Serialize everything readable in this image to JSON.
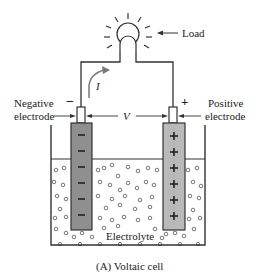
{
  "diagram": {
    "caption": "(A) Voltaic cell",
    "labels": {
      "load": "Load",
      "negative_electrode_line1": "Negative",
      "negative_electrode_line2": "electrode",
      "positive_electrode_line1": "Positive",
      "positive_electrode_line2": "electrode",
      "voltage": "V",
      "current": "I",
      "electrolyte": "Electrolyte",
      "negative_sign": "−",
      "positive_sign": "+"
    },
    "electrodes": {
      "negative": {
        "charge_marks": [
          "−",
          "−",
          "−",
          "−",
          "−",
          "−"
        ],
        "fill": "#8f8f8f"
      },
      "positive": {
        "charge_marks": [
          "+",
          "+",
          "+",
          "+",
          "+",
          "+"
        ],
        "fill": "#b9b9b9"
      }
    },
    "colors": {
      "line": "#333333",
      "current_arrow": "#7a7a7a"
    }
  }
}
